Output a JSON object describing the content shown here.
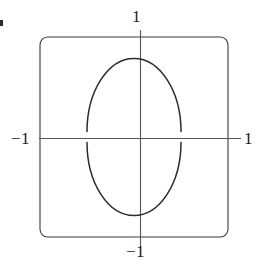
{
  "figure": {
    "type": "math-diagram",
    "background_color": "#ffffff",
    "line_color": "#2b2b2b",
    "axis_color": "#555555",
    "labels": {
      "top": "1",
      "bottom": "−1",
      "left": "−1",
      "right": "1"
    }
  },
  "chart_data": {
    "type": "line",
    "title": "",
    "subtitle": "",
    "xlabel": "",
    "ylabel": "",
    "xlim": [
      -1,
      1
    ],
    "ylim": [
      -1,
      1
    ],
    "grid": false,
    "legend": "none",
    "xticks": [
      -1,
      1
    ],
    "xticklabels": [
      "−1",
      "1"
    ],
    "yticks": [
      -1,
      1
    ],
    "yticklabels": [
      "−1",
      "1"
    ],
    "annotations": [],
    "series": [
      {
        "name": "ellipse",
        "shape": "ellipse",
        "center": [
          0,
          0
        ],
        "semi_axis_x": 0.5,
        "semi_axis_y": 0.73,
        "closed": true
      }
    ],
    "frame": {
      "shape": "rounded-square",
      "x_range": [
        -1,
        1
      ],
      "y_range": [
        -1,
        1
      ],
      "corner_radius": 0.08
    },
    "axes_drawn": {
      "horizontal": true,
      "vertical": true,
      "extends_beyond_frame": true
    }
  }
}
